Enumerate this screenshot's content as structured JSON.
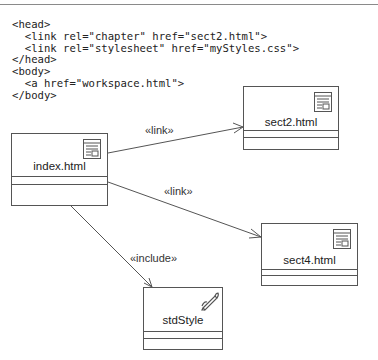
{
  "code_snippet": {
    "lines": [
      "<head>",
      "  <link rel=\"chapter\" href=\"sect2.html\">",
      "  <link rel=\"stylesheet\" href=\"myStyles.css\">",
      "</head>",
      "<body>",
      "  <a href=\"workspace.html\">",
      "</body>"
    ]
  },
  "nodes": [
    {
      "id": "index",
      "name": "index.html",
      "icon": "web-page-icon"
    },
    {
      "id": "sect2",
      "name": "sect2.html",
      "icon": "web-page-icon"
    },
    {
      "id": "sect4",
      "name": "sect4.html",
      "icon": "web-page-icon"
    },
    {
      "id": "stdStyle",
      "name": "stdStyle",
      "icon": "pencil-icon"
    }
  ],
  "edges": [
    {
      "from": "index",
      "to": "sect2",
      "label": "«link»"
    },
    {
      "from": "index",
      "to": "sect4",
      "label": "«link»"
    },
    {
      "from": "index",
      "to": "stdStyle",
      "label": "«include»"
    }
  ],
  "colors": {
    "line": "#555555",
    "text": "#222222",
    "rule": "#8a8a8a"
  }
}
